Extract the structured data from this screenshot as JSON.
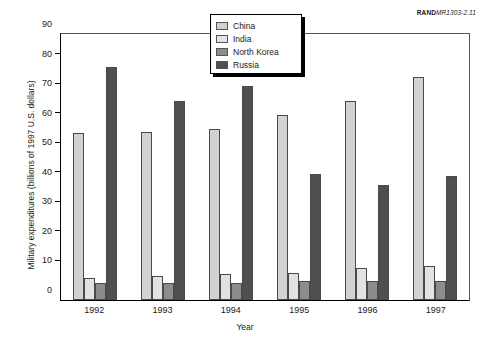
{
  "source_credit": {
    "brand": "RAND",
    "document_id": "MR1303-2.11"
  },
  "chart_data": {
    "type": "bar",
    "title": "",
    "xlabel": "Year",
    "ylabel": "Military expenditures (billions of 1997 U.S. dollars)",
    "categories": [
      "1992",
      "1993",
      "1994",
      "1995",
      "1996",
      "1997"
    ],
    "yticks": [
      "0",
      "10",
      "20",
      "30",
      "40",
      "50",
      "60",
      "70",
      "80",
      "90"
    ],
    "ylim": [
      0,
      90
    ],
    "grid": false,
    "legend_position": "top-center",
    "series": [
      {
        "name": "China",
        "color": "#d2d2d2",
        "values": [
          56.5,
          57.0,
          57.8,
          62.5,
          67.5,
          75.5
        ]
      },
      {
        "name": "India",
        "color": "#e2e2e2",
        "values": [
          7.5,
          8.0,
          8.8,
          9.0,
          10.8,
          11.5
        ]
      },
      {
        "name": "North Korea",
        "color": "#8c8c8c",
        "values": [
          5.8,
          5.6,
          5.7,
          6.3,
          6.4,
          6.6
        ]
      },
      {
        "name": "Russia",
        "color": "#4f4f4f",
        "values": [
          79.0,
          67.2,
          72.5,
          42.5,
          39.0,
          42.0
        ]
      }
    ]
  }
}
